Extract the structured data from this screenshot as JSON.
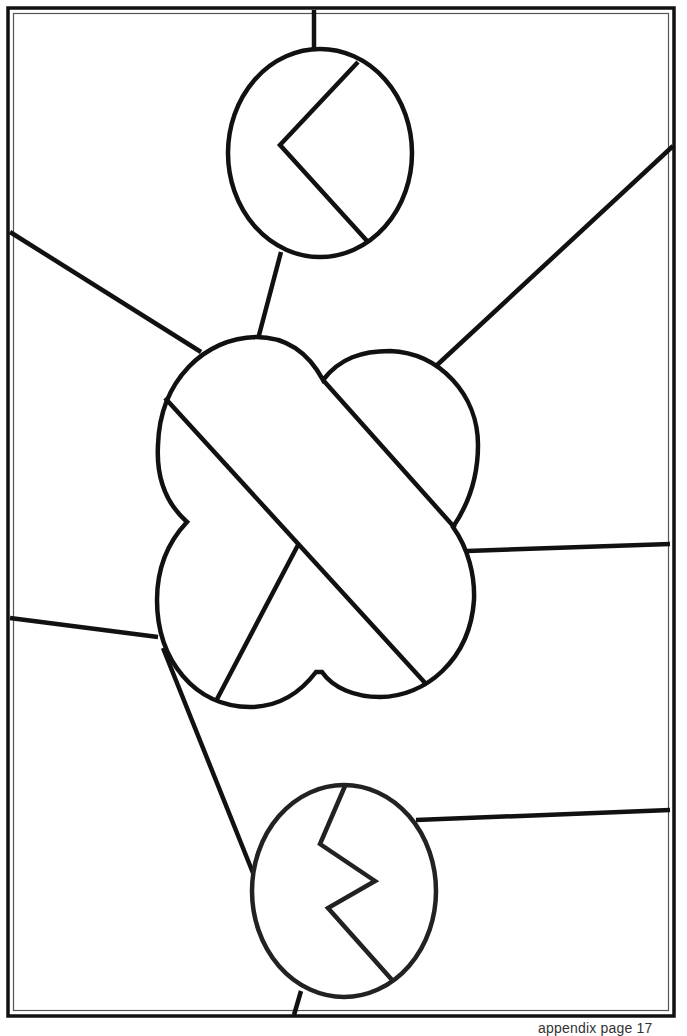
{
  "page": {
    "caption": "appendix page 17",
    "background": "#ffffff",
    "line_color": "#111111"
  },
  "diagram": {
    "type": "stained-glass-pattern",
    "border": {
      "style": "double",
      "outer": [
        8,
        8,
        674,
        1016
      ],
      "inner": [
        13,
        13,
        669,
        1011
      ]
    },
    "shapes": [
      {
        "name": "top-ellipse",
        "cx": 320,
        "cy": 153,
        "rx": 93,
        "ry": 105
      },
      {
        "name": "center-quatrefoil",
        "lobes": 4
      },
      {
        "name": "bottom-ellipse",
        "cx": 344,
        "cy": 891,
        "rx": 93,
        "ry": 107
      }
    ],
    "inner_lines": [
      {
        "name": "top-chevron",
        "points": [
          [
            358,
            62
          ],
          [
            280,
            145
          ],
          [
            368,
            242
          ]
        ]
      },
      {
        "name": "bottom-zigzag",
        "points": [
          [
            345,
            786
          ],
          [
            320,
            844
          ],
          [
            375,
            881
          ],
          [
            328,
            908
          ],
          [
            393,
            981
          ]
        ]
      },
      {
        "name": "center-diagonal-main",
        "points": [
          [
            165,
            398
          ],
          [
            427,
            685
          ]
        ]
      },
      {
        "name": "center-diagonal-second",
        "points": [
          [
            323,
            380
          ],
          [
            455,
            528
          ]
        ]
      },
      {
        "name": "center-diagonal-short",
        "points": [
          [
            298,
            545
          ],
          [
            216,
            700
          ]
        ]
      }
    ],
    "lead_lines": [
      {
        "name": "top-vertical",
        "points": [
          [
            314,
            8
          ],
          [
            314,
            48
          ]
        ]
      },
      {
        "name": "top-ellipse-to-center",
        "points": [
          [
            281,
            252
          ],
          [
            258,
            338
          ]
        ]
      },
      {
        "name": "left-upper",
        "points": [
          [
            9,
            232
          ],
          [
            200,
            352
          ]
        ]
      },
      {
        "name": "right-upper",
        "points": [
          [
            436,
            366
          ],
          [
            674,
            145
          ]
        ]
      },
      {
        "name": "right-middle",
        "points": [
          [
            467,
            551
          ],
          [
            670,
            544
          ]
        ]
      },
      {
        "name": "left-lower",
        "points": [
          [
            9,
            618
          ],
          [
            158,
            638
          ]
        ]
      },
      {
        "name": "center-to-bottom-ellipse",
        "points": [
          [
            166,
            656
          ],
          [
            253,
            873
          ]
        ]
      },
      {
        "name": "right-lower",
        "points": [
          [
            416,
            820
          ],
          [
            670,
            810
          ]
        ]
      },
      {
        "name": "bottom-vertical",
        "points": [
          [
            301,
            990
          ],
          [
            293,
            1016
          ]
        ]
      }
    ]
  }
}
